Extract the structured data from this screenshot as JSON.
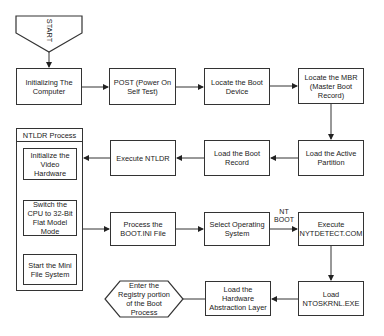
{
  "diagram": {
    "start": {
      "label": "START"
    },
    "nodes": [
      {
        "id": "init",
        "label": "Initializing The Computer"
      },
      {
        "id": "post",
        "label": "POST (Power On Self Test)"
      },
      {
        "id": "bootdev",
        "label": "Locate the Boot Device"
      },
      {
        "id": "mbr",
        "label": "Locate the MBR (Master Boot Record)"
      },
      {
        "id": "active",
        "label": "Load the Active Partition"
      },
      {
        "id": "bootrec",
        "label": "Load the Boot Record"
      },
      {
        "id": "ntldr",
        "label": "Execute NTLDR"
      },
      {
        "id": "bootini",
        "label": "Process the BOOT.INI File"
      },
      {
        "id": "selectos",
        "label": "Select Operating System"
      },
      {
        "id": "ntdetect",
        "label": "Execute NYTDETECT.COM"
      },
      {
        "id": "ntoskrnl",
        "label": "Load NTOSKRNL.EXE"
      },
      {
        "id": "hal",
        "label": "Load the Hardware Abstraction Layer"
      },
      {
        "id": "registry",
        "label": "Enter the Registry portion of the Boot Process"
      }
    ],
    "ntldr_process": {
      "title": "NTLDR Process",
      "steps": [
        {
          "id": "video",
          "label": "Initialize the Video Hardware"
        },
        {
          "id": "cpu",
          "label": "Switch the CPU to 32-Bit Flat Model Mode"
        },
        {
          "id": "minifs",
          "label": "Start the Mini File System"
        }
      ]
    },
    "edge_labels": {
      "nt_boot": "NT BOOT"
    },
    "edges": [
      [
        "start",
        "init"
      ],
      [
        "init",
        "post"
      ],
      [
        "post",
        "bootdev"
      ],
      [
        "bootdev",
        "mbr"
      ],
      [
        "mbr",
        "active"
      ],
      [
        "active",
        "bootrec"
      ],
      [
        "bootrec",
        "ntldr"
      ],
      [
        "ntldr",
        "video"
      ],
      [
        "video",
        "cpu"
      ],
      [
        "cpu",
        "minifs"
      ],
      [
        "cpu",
        "bootini"
      ],
      [
        "bootini",
        "selectos"
      ],
      [
        "selectos",
        "ntdetect"
      ],
      [
        "ntdetect",
        "ntoskrnl"
      ],
      [
        "ntoskrnl",
        "hal"
      ],
      [
        "hal",
        "registry"
      ]
    ],
    "colors": {
      "stroke": "#333333",
      "fill": "#ffffff",
      "text": "#1a1a1a"
    }
  }
}
